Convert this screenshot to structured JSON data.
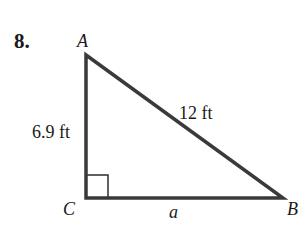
{
  "problem": {
    "number": "8."
  },
  "triangle": {
    "vertices": {
      "A": "A",
      "B": "B",
      "C": "C"
    },
    "sides": {
      "AC": "6.9 ft",
      "AB": "12 ft",
      "CB": "a"
    },
    "right_angle_at": "C",
    "stroke_color": "#3a3a3a"
  }
}
